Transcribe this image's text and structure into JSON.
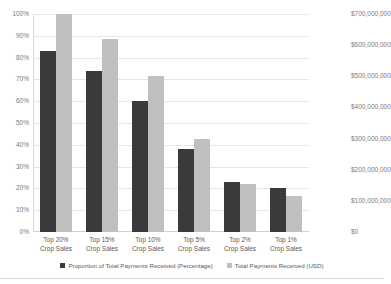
{
  "chart_data": {
    "type": "bar",
    "title": "",
    "xlabel": "",
    "ylabel": "",
    "y2label": "",
    "grid": true,
    "legend_position": "bottom",
    "categories": [
      "Top 20%\nCrop Sales",
      "Top 15%\nCrop Sales",
      "Top 10%\nCrop Sales",
      "Top 5%\nCrop Sales",
      "Top 2%\nCrop Sales",
      "Top 1%\nCrop Sales"
    ],
    "categories_line1": [
      "Top 20%",
      "Top 15%",
      "Top 10%",
      "Top 5%",
      "Top 2%",
      "Top 1%"
    ],
    "categories_line2": [
      "Crop Sales",
      "Crop Sales",
      "Crop Sales",
      "Crop Sales",
      "Crop Sales",
      "Crop Sales"
    ],
    "series": [
      {
        "name": "Proportion of Total Payments Received (Percentage)",
        "axis": "left",
        "color": "#3a3a3a",
        "values": [
          83,
          74,
          60,
          38,
          23,
          20
        ],
        "unit": "%"
      },
      {
        "name": "Total Payments Received (USD)",
        "axis": "right",
        "color": "#bfbfbf",
        "values": [
          700000000,
          620000000,
          500000000,
          298000000,
          154000000,
          116000000
        ],
        "unit": "USD"
      }
    ],
    "ylim": [
      0,
      100
    ],
    "y2lim": [
      0,
      700000000
    ],
    "yticks": [
      0,
      10,
      20,
      30,
      40,
      50,
      60,
      70,
      80,
      90,
      100
    ],
    "ytick_labels": [
      "0%",
      "10%",
      "20%",
      "30%",
      "40%",
      "50%",
      "60%",
      "70%",
      "80%",
      "90%",
      "100%"
    ],
    "y2ticks": [
      0,
      100000000,
      200000000,
      300000000,
      400000000,
      500000000,
      600000000,
      700000000
    ],
    "y2tick_labels": [
      "$0",
      "$100,000,000",
      "$200,000,000",
      "$300,000,000",
      "$400,000,000",
      "$500,000,000",
      "$600,000,000",
      "$700,000,000"
    ]
  },
  "legend": {
    "items": [
      {
        "label": "Proportion of Total Payments Received (Percentage)",
        "color": "#3a3a3a"
      },
      {
        "label": "Total Payments Received (USD)",
        "color": "#bfbfbf"
      }
    ]
  },
  "colors": {
    "bar_percentage": "#3a3a3a",
    "bar_usd": "#bfbfbf",
    "gridline": "#e6e6e6",
    "tick_text": "#7b7b7b",
    "label_text": "#5a5a5a",
    "background": "#ffffff"
  }
}
